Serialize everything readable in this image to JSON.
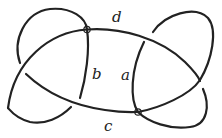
{
  "diagram": {
    "type": "virtual knot diagram",
    "stroke_color": "#222222",
    "background": "#ffffff",
    "labels": [
      {
        "id": "d",
        "text": "d"
      },
      {
        "id": "b",
        "text": "b"
      },
      {
        "id": "a",
        "text": "a"
      },
      {
        "id": "c",
        "text": "c"
      }
    ],
    "virtual_crossings": 2,
    "classical_crossings": 4
  }
}
